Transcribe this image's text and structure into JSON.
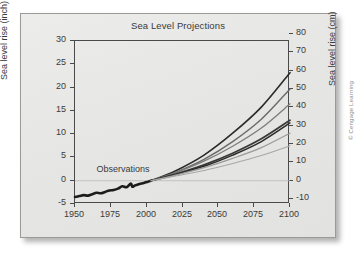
{
  "figure": {
    "credit": "© Cengage Learning"
  },
  "chart_data": {
    "type": "line",
    "title": "Sea Level Projections",
    "xlabel": "",
    "ylabel": "Sea level rise (inch)",
    "y2label": "Sea level rise (cm)",
    "grid": false,
    "legend_position": "none",
    "xlim": [
      1950,
      2100
    ],
    "ylim": [
      -5,
      30
    ],
    "y2lim": [
      -12.7,
      76.2
    ],
    "xticks": [
      "1950",
      "1975",
      "2000",
      "2025",
      "2050",
      "2075",
      "2100"
    ],
    "xtick_values": [
      1950,
      1975,
      2000,
      2025,
      2050,
      2075,
      2100
    ],
    "yticks": [
      "30",
      "25",
      "20",
      "15",
      "10",
      "5",
      "0",
      "-5"
    ],
    "ytick_values": [
      30,
      25,
      20,
      15,
      10,
      5,
      0,
      -5
    ],
    "y2ticks": [
      "80",
      "70",
      "60",
      "50",
      "40",
      "30",
      "20",
      "10",
      "0",
      "-10"
    ],
    "y2tick_values": [
      80,
      70,
      60,
      50,
      40,
      30,
      20,
      10,
      0,
      -10
    ],
    "annotations": [
      {
        "text": "Observations",
        "x": 1965,
        "y": 2.2
      }
    ],
    "series": [
      {
        "name": "Observations",
        "kind": "observed",
        "color": "#1c1c1c",
        "width": 2.6,
        "x": [
          1950,
          1953,
          1956,
          1959,
          1962,
          1965,
          1968,
          1971,
          1974,
          1977,
          1980,
          1983,
          1986,
          1989,
          1990,
          1992,
          1995,
          1998,
          2001,
          2003
        ],
        "y": [
          -3.5,
          -3.3,
          -3.1,
          -3.2,
          -2.9,
          -2.6,
          -2.7,
          -2.4,
          -2.1,
          -2.0,
          -1.7,
          -1.2,
          -1.4,
          -0.6,
          -1.3,
          -1.0,
          -0.7,
          -0.5,
          -0.2,
          0.0
        ]
      },
      {
        "name": "Projection A1FI high",
        "kind": "projection",
        "color": "#2a2a2a",
        "width": 1.6,
        "x": [
          2003,
          2020,
          2040,
          2060,
          2080,
          2100
        ],
        "y": [
          0.0,
          2.1,
          5.5,
          10.2,
          15.8,
          23.2
        ]
      },
      {
        "name": "Projection A2",
        "kind": "projection",
        "color": "#6a6a6a",
        "width": 1.4,
        "x": [
          2003,
          2020,
          2040,
          2060,
          2080,
          2100
        ],
        "y": [
          0.0,
          1.8,
          4.6,
          8.4,
          13.2,
          19.7
        ]
      },
      {
        "name": "Projection A1B",
        "kind": "projection",
        "color": "#7d7d7d",
        "width": 1.3,
        "x": [
          2003,
          2020,
          2040,
          2060,
          2080,
          2100
        ],
        "y": [
          0.0,
          1.7,
          4.2,
          7.4,
          11.3,
          16.5
        ]
      },
      {
        "name": "Projection B2",
        "kind": "projection",
        "color": "#3a3a3a",
        "width": 1.8,
        "x": [
          2003,
          2020,
          2040,
          2060,
          2080,
          2100
        ],
        "y": [
          0.0,
          1.4,
          3.4,
          5.9,
          9.0,
          13.0
        ]
      },
      {
        "name": "Projection B1",
        "kind": "projection",
        "color": "#2b2b2b",
        "width": 1.5,
        "x": [
          2003,
          2020,
          2040,
          2060,
          2080,
          2100
        ],
        "y": [
          0.0,
          1.3,
          3.1,
          5.5,
          8.4,
          12.4
        ]
      },
      {
        "name": "Projection A1T",
        "kind": "projection",
        "color": "#9a9a9a",
        "width": 1.2,
        "x": [
          2003,
          2020,
          2040,
          2060,
          2080,
          2100
        ],
        "y": [
          0.0,
          1.2,
          2.8,
          4.8,
          7.1,
          10.2
        ]
      },
      {
        "name": "Projection low",
        "kind": "projection",
        "color": "#a8a8a8",
        "width": 1.1,
        "x": [
          2003,
          2020,
          2040,
          2060,
          2080,
          2100
        ],
        "y": [
          0.0,
          1.0,
          2.2,
          3.7,
          5.4,
          7.5
        ]
      }
    ],
    "zero_line": {
      "y": 0,
      "color": "#b9b9b7"
    }
  }
}
